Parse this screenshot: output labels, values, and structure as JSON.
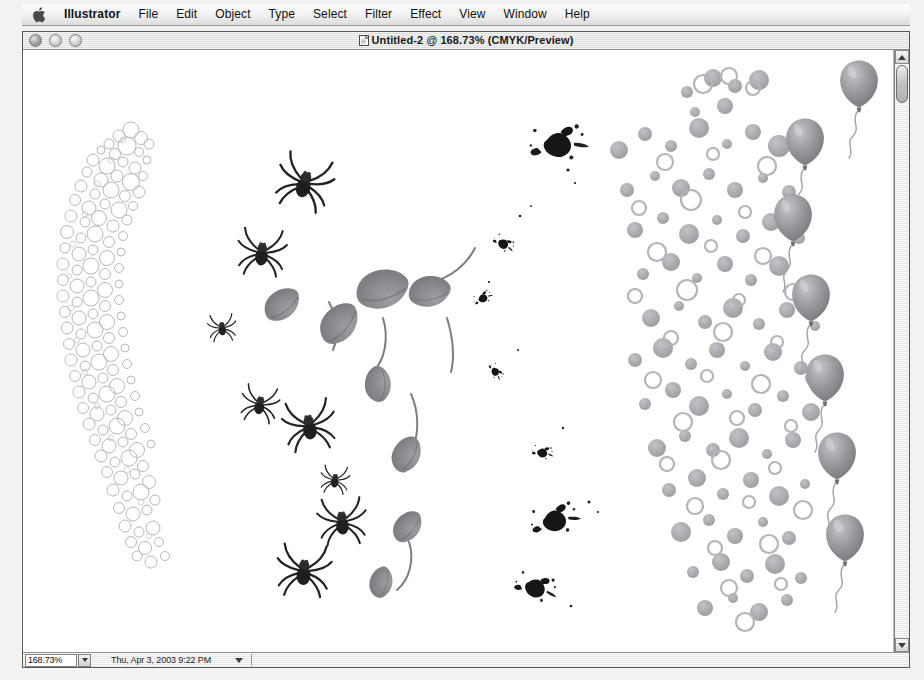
{
  "menubar": {
    "apple_icon": "apple-logo-icon",
    "items": [
      {
        "label": "Illustrator",
        "bold": true
      },
      {
        "label": "File",
        "bold": false
      },
      {
        "label": "Edit",
        "bold": false
      },
      {
        "label": "Object",
        "bold": false
      },
      {
        "label": "Type",
        "bold": false
      },
      {
        "label": "Select",
        "bold": false
      },
      {
        "label": "Filter",
        "bold": false
      },
      {
        "label": "Effect",
        "bold": false
      },
      {
        "label": "View",
        "bold": false
      },
      {
        "label": "Window",
        "bold": false
      },
      {
        "label": "Help",
        "bold": false
      }
    ]
  },
  "window": {
    "title": "Untitled-2 @ 168.73% (CMYK/Preview)",
    "controls": [
      {
        "name": "close-button"
      },
      {
        "name": "minimize-button"
      },
      {
        "name": "zoom-button"
      }
    ]
  },
  "statusbar": {
    "zoom_value": "168.73%",
    "status_text": "Thu, Apr 3, 2003  9:22 PM"
  },
  "artwork": {
    "colors": {
      "bubble_outline": "#b9b9bd",
      "spider_dark": "#2b2b2b",
      "leaf_gray": "#8e8e92",
      "splat_black": "#161616",
      "dot_gray": "#a9a9ad",
      "dot_ring": "#bcbcc0",
      "balloon_gray": "#9a9a9e",
      "string_gray": "#a6a6aa"
    },
    "objects": [
      {
        "name": "bubble-brush-stroke",
        "kind": "scatter-circles-path"
      },
      {
        "name": "spider-brush-stroke",
        "kind": "scatter-spiders-path"
      },
      {
        "name": "leaf-brush-stroke",
        "kind": "scatter-leaves-path"
      },
      {
        "name": "ink-splatter-stroke",
        "kind": "scatter-splats-path"
      },
      {
        "name": "confetti-dots-stroke",
        "kind": "scatter-dots-path"
      },
      {
        "name": "balloon-brush-stroke",
        "kind": "scatter-balloons-path"
      }
    ]
  }
}
